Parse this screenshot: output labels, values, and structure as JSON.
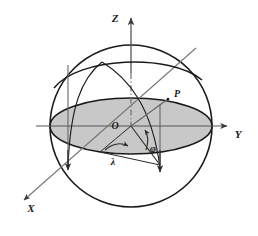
{
  "figure": {
    "background_color": "#ffffff",
    "stroke_color": "#1a1a1a",
    "axis_color": "#555555",
    "equator_fill": "#c8c8c8",
    "sphere_fill": "#ffffff"
  },
  "labels": {
    "z_axis": "Z",
    "y_axis": "Y",
    "x_axis": "X",
    "origin": "O",
    "point_p": "P",
    "angle_phi": "φ",
    "angle_lambda": "λ"
  },
  "geometry": {
    "sphere_center_x": 131,
    "sphere_center_y": 126,
    "sphere_radius": 81,
    "equator_rx": 81,
    "equator_ry": 28,
    "point_p_x": 168,
    "point_p_y": 99
  }
}
